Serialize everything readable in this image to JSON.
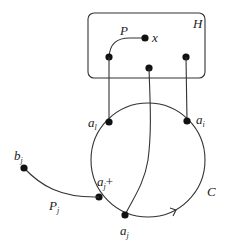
{
  "diagram": {
    "box_label": "H",
    "path_label": "P",
    "vertex_x_label": "x",
    "circle_label": "C",
    "vertices": {
      "a_l": {
        "base": "a",
        "sub": "l"
      },
      "a_i": {
        "base": "a",
        "sub": "i"
      },
      "a_j_plus": {
        "base": "a",
        "sub": "j",
        "suffix": "+"
      },
      "a_j": {
        "base": "a",
        "sub": "j"
      },
      "b_j": {
        "base": "b",
        "sub": "j"
      }
    },
    "path_j_label": {
      "base": "P",
      "sub": "j"
    },
    "colors": {
      "stroke": "#333333",
      "node": "#111111",
      "text": "#222222"
    }
  }
}
